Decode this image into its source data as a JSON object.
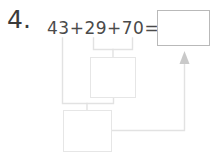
{
  "worksheet": {
    "problem_number": "4.",
    "equation": "43+29+70=",
    "addends": [
      43,
      29,
      70
    ],
    "operator": "+",
    "equals_sign": "=",
    "answer_box": {
      "label": "answer-box",
      "value": "",
      "placeholder": ""
    },
    "work_boxes": [
      {
        "label": "partial-sum-box",
        "value": "",
        "placeholder": ""
      },
      {
        "label": "total-sum-box",
        "value": "",
        "placeholder": ""
      }
    ],
    "connectors": {
      "bracket_upper_label": "bracket-29-plus-70",
      "bracket_lower_label": "bracket-43-plus-partial",
      "arrow_label": "arrow-to-answer"
    },
    "colors": {
      "background": "#ffffff",
      "text": "#3a3a3a",
      "equation_text": "#4a4a4a",
      "answer_border": "#b9b9b9",
      "work_border": "#e6e6e6",
      "connector_line": "#e2e2e2",
      "arrow_fill": "#c9c9c9"
    }
  }
}
